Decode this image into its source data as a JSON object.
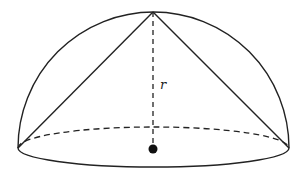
{
  "diagram": {
    "labels": {
      "radius": "r"
    },
    "geometry": {
      "base_center": [
        153,
        147
      ],
      "apex": [
        153,
        12
      ],
      "base_left": [
        18,
        148
      ],
      "base_right": [
        289,
        148
      ],
      "base_rx": 135,
      "base_ry": 20,
      "radius_label_pos": [
        162,
        88
      ]
    },
    "colors": {
      "stroke": "#222222",
      "background": "#ffffff"
    },
    "elements": [
      {
        "name": "hemisphere-dome-outline",
        "style": "solid"
      },
      {
        "name": "base-ellipse-front-arc",
        "style": "solid"
      },
      {
        "name": "base-ellipse-back-arc",
        "style": "dashed"
      },
      {
        "name": "cone-left-slant-edge",
        "style": "solid"
      },
      {
        "name": "cone-right-slant-edge",
        "style": "solid"
      },
      {
        "name": "radius-height-line",
        "style": "dashed"
      },
      {
        "name": "center-point",
        "style": "filled-dot"
      }
    ]
  }
}
